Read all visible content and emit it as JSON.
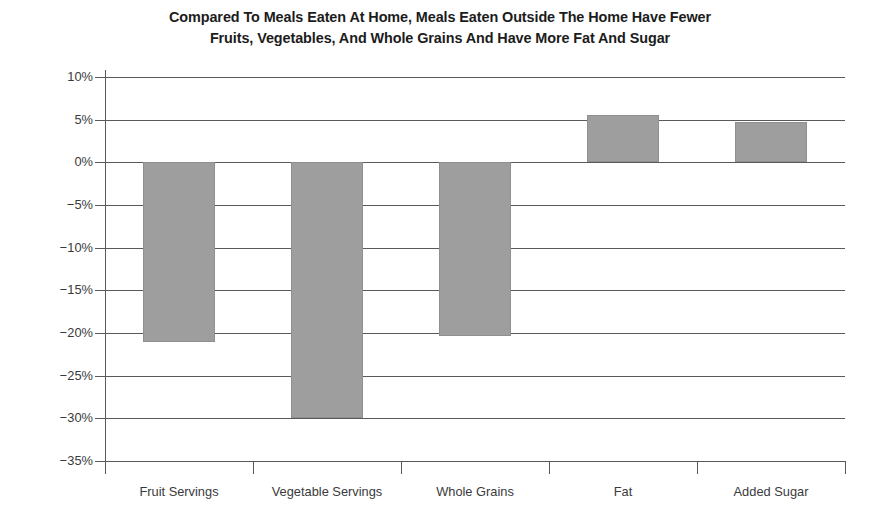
{
  "chart_data": {
    "type": "bar",
    "title": "Compared To Meals Eaten At Home, Meals Eaten Outside The Home Have Fewer Fruits, Vegetables, And Whole Grains And Have More Fat And Sugar",
    "title_lines": [
      "Compared To Meals Eaten At Home, Meals Eaten Outside The Home Have Fewer",
      "Fruits, Vegetables, And Whole Grains And Have More Fat And Sugar"
    ],
    "categories": [
      "Fruit Servings",
      "Vegetable Servings",
      "Whole Grains",
      "Fat",
      "Added Sugar"
    ],
    "values": [
      -21,
      -30,
      -20.3,
      5.5,
      4.7
    ],
    "value_labels": [
      "-21%",
      "-30%",
      "-20.3%",
      "5.5%",
      "4.7%"
    ],
    "xlabel": "",
    "ylabel": "",
    "ylim": [
      -35,
      10
    ],
    "ytick_values": [
      10,
      5,
      0,
      -5,
      -10,
      -15,
      -20,
      -25,
      -30,
      -35
    ],
    "ytick_labels": [
      "10%",
      "5%",
      "0%",
      "−5%",
      "−10%",
      "−15%",
      "−20%",
      "−25%",
      "−30%",
      "−35%"
    ],
    "grid": true,
    "legend": false,
    "bar_color": "#9e9e9e",
    "axis_color": "#59595b",
    "text_color": "#3a3a3c"
  }
}
